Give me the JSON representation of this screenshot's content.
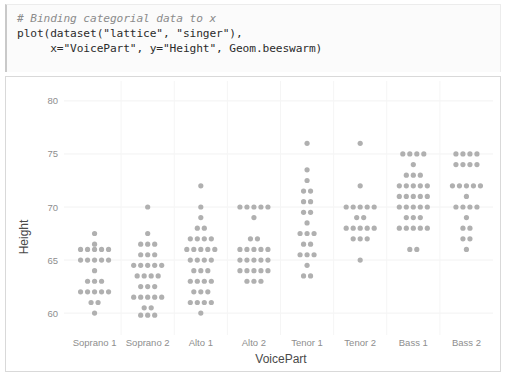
{
  "code_cell": {
    "comment": "# Binding categorial data to x",
    "lines": [
      "plot(dataset(\"lattice\", \"singer\"),",
      "     x=\"VoicePart\", y=\"Height\", Geom.beeswarm)"
    ]
  },
  "chart_data": {
    "type": "scatter",
    "subtype": "beeswarm",
    "title": "",
    "xlabel": "VoicePart",
    "ylabel": "Height",
    "grid": true,
    "legend": false,
    "categories": [
      "Soprano 1",
      "Soprano 2",
      "Alto 1",
      "Alto 2",
      "Tenor 1",
      "Tenor 2",
      "Bass 1",
      "Bass 2"
    ],
    "ylim": [
      58.5,
      81.5
    ],
    "yticks": [
      60,
      65,
      70,
      75,
      80
    ],
    "dot_color": "#b0b0b0",
    "groups": [
      {
        "name": "Soprano 1",
        "bins": [
          {
            "height": 67.5,
            "count": 1
          },
          {
            "height": 66.5,
            "count": 1
          },
          {
            "height": 66.0,
            "count": 5
          },
          {
            "height": 65.0,
            "count": 5
          },
          {
            "height": 64.0,
            "count": 1
          },
          {
            "height": 63.0,
            "count": 3
          },
          {
            "height": 62.0,
            "count": 5
          },
          {
            "height": 61.0,
            "count": 2
          },
          {
            "height": 60.0,
            "count": 1
          }
        ]
      },
      {
        "name": "Soprano 2",
        "bins": [
          {
            "height": 70.0,
            "count": 1
          },
          {
            "height": 67.5,
            "count": 1
          },
          {
            "height": 66.5,
            "count": 3
          },
          {
            "height": 65.5,
            "count": 3
          },
          {
            "height": 64.5,
            "count": 5
          },
          {
            "height": 63.5,
            "count": 4
          },
          {
            "height": 62.5,
            "count": 3
          },
          {
            "height": 61.5,
            "count": 5
          },
          {
            "height": 60.5,
            "count": 2
          },
          {
            "height": 59.8,
            "count": 3
          }
        ]
      },
      {
        "name": "Alto 1",
        "bins": [
          {
            "height": 72.0,
            "count": 1
          },
          {
            "height": 70.0,
            "count": 1
          },
          {
            "height": 69.0,
            "count": 1
          },
          {
            "height": 68.0,
            "count": 2
          },
          {
            "height": 67.0,
            "count": 4
          },
          {
            "height": 66.0,
            "count": 5
          },
          {
            "height": 65.0,
            "count": 4
          },
          {
            "height": 64.0,
            "count": 3
          },
          {
            "height": 63.0,
            "count": 4
          },
          {
            "height": 62.0,
            "count": 3
          },
          {
            "height": 61.0,
            "count": 4
          },
          {
            "height": 60.0,
            "count": 1
          }
        ]
      },
      {
        "name": "Alto 2",
        "bins": [
          {
            "height": 70.0,
            "count": 5
          },
          {
            "height": 69.0,
            "count": 1
          },
          {
            "height": 67.0,
            "count": 2
          },
          {
            "height": 66.0,
            "count": 5
          },
          {
            "height": 65.0,
            "count": 5
          },
          {
            "height": 64.0,
            "count": 5
          },
          {
            "height": 63.0,
            "count": 3
          }
        ]
      },
      {
        "name": "Tenor 1",
        "bins": [
          {
            "height": 76.0,
            "count": 1
          },
          {
            "height": 73.5,
            "count": 1
          },
          {
            "height": 72.5,
            "count": 1
          },
          {
            "height": 71.5,
            "count": 2
          },
          {
            "height": 70.5,
            "count": 2
          },
          {
            "height": 69.5,
            "count": 2
          },
          {
            "height": 68.5,
            "count": 1
          },
          {
            "height": 67.5,
            "count": 3
          },
          {
            "height": 66.5,
            "count": 2
          },
          {
            "height": 65.5,
            "count": 3
          },
          {
            "height": 64.5,
            "count": 1
          },
          {
            "height": 63.5,
            "count": 2
          }
        ]
      },
      {
        "name": "Tenor 2",
        "bins": [
          {
            "height": 76.0,
            "count": 1
          },
          {
            "height": 72.0,
            "count": 1
          },
          {
            "height": 70.0,
            "count": 5
          },
          {
            "height": 69.0,
            "count": 2
          },
          {
            "height": 68.0,
            "count": 5
          },
          {
            "height": 67.0,
            "count": 3
          },
          {
            "height": 65.0,
            "count": 1
          }
        ]
      },
      {
        "name": "Bass 1",
        "bins": [
          {
            "height": 75.0,
            "count": 4
          },
          {
            "height": 74.0,
            "count": 1
          },
          {
            "height": 73.0,
            "count": 3
          },
          {
            "height": 72.0,
            "count": 5
          },
          {
            "height": 71.0,
            "count": 5
          },
          {
            "height": 70.0,
            "count": 5
          },
          {
            "height": 69.0,
            "count": 3
          },
          {
            "height": 68.0,
            "count": 5
          },
          {
            "height": 66.0,
            "count": 2
          }
        ]
      },
      {
        "name": "Bass 2",
        "bins": [
          {
            "height": 75.0,
            "count": 4
          },
          {
            "height": 74.0,
            "count": 4
          },
          {
            "height": 72.0,
            "count": 5
          },
          {
            "height": 71.0,
            "count": 1
          },
          {
            "height": 70.0,
            "count": 4
          },
          {
            "height": 69.0,
            "count": 1
          },
          {
            "height": 68.0,
            "count": 2
          },
          {
            "height": 67.0,
            "count": 2
          },
          {
            "height": 66.0,
            "count": 1
          }
        ]
      }
    ]
  }
}
